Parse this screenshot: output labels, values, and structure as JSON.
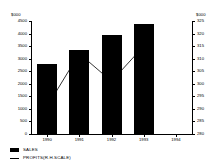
{
  "chart_data": {
    "type": "bar",
    "title": "",
    "categories": [
      "1990",
      "1991",
      "1992",
      "1993",
      "1994"
    ],
    "series": [
      {
        "name": "SALES",
        "type": "bar",
        "axis": "left",
        "values": [
          2800,
          3350,
          3950,
          4400,
          null
        ]
      },
      {
        "name": "PROFITS(R.H.SCALE)",
        "type": "line",
        "axis": "right",
        "values": [
          291,
          312,
          301,
          315,
          null
        ]
      }
    ],
    "xlabel": "",
    "ylabel": "$000",
    "y2label": "$000",
    "ylim": [
      0,
      4500
    ],
    "y2lim": [
      280,
      325
    ],
    "yticks": [
      0,
      500,
      1000,
      1500,
      2000,
      2500,
      3000,
      3500,
      4000,
      4500
    ],
    "ytick_labels": [
      "0",
      "500",
      "1000",
      "1500",
      "2000",
      "2500",
      "3000",
      "3500",
      "4000",
      "4500"
    ],
    "y2ticks": [
      280,
      285,
      290,
      295,
      300,
      305,
      310,
      315,
      320,
      325
    ],
    "y2tick_labels": [
      "280",
      "285",
      "290",
      "295",
      "300",
      "305",
      "310",
      "315",
      "320",
      "325"
    ],
    "grid": false,
    "legend_position": "bottom-left"
  },
  "axes": {
    "left_unit": "$000",
    "right_unit": "$000"
  },
  "legend": {
    "items": [
      {
        "label": "SALES",
        "marker": "filled-square"
      },
      {
        "label": "PROFITS(R.H.SCALE)",
        "marker": "line"
      }
    ]
  },
  "colors": {
    "bar": "#000000",
    "line": "#000000",
    "axis": "#000000",
    "background": "#ffffff"
  }
}
